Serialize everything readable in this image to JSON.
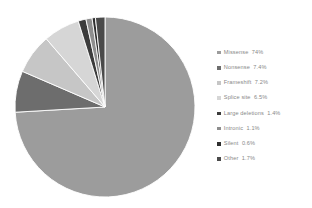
{
  "chart_data": {
    "type": "pie",
    "title": "",
    "subtitle": "",
    "xlabel": "",
    "ylabel": "",
    "legend_position": "right",
    "grid": false,
    "start_angle_deg": 0,
    "direction": "clockwise",
    "categories": [
      "Missense",
      "Nonsense",
      "Frameshift",
      "Splice site",
      "Large deletions",
      "Intronic",
      "Silent",
      "Other"
    ],
    "values": [
      74,
      7.4,
      7.2,
      6.5,
      1.4,
      1.1,
      0.6,
      1.7
    ],
    "value_labels": [
      "74%",
      "7.4%",
      "7.2%",
      "6.5%",
      "1.4%",
      "1.1%",
      "0.6%",
      "1.7%"
    ],
    "unit": "%",
    "colors": [
      "#9c9c9c",
      "#6d6d6d",
      "#c6c6c6",
      "#d6d6d6",
      "#3c3c3c",
      "#8e8e8e",
      "#2f2f2f",
      "#4a4a4a"
    ],
    "slices": [
      {
        "label": "Missense",
        "value": 74,
        "value_label": "74%",
        "color": "#9c9c9c"
      },
      {
        "label": "Nonsense",
        "value": 7.4,
        "value_label": "7.4%",
        "color": "#6d6d6d"
      },
      {
        "label": "Frameshift",
        "value": 7.2,
        "value_label": "7.2%",
        "color": "#c6c6c6"
      },
      {
        "label": "Splice site",
        "value": 6.5,
        "value_label": "6.5%",
        "color": "#d6d6d6"
      },
      {
        "label": "Large deletions",
        "value": 1.4,
        "value_label": "1.4%",
        "color": "#3c3c3c"
      },
      {
        "label": "Intronic",
        "value": 1.1,
        "value_label": "1.1%",
        "color": "#8e8e8e"
      },
      {
        "label": "Silent",
        "value": 0.6,
        "value_label": "0.6%",
        "color": "#2f2f2f"
      },
      {
        "label": "Other",
        "value": 1.7,
        "value_label": "1.7%",
        "color": "#4a4a4a"
      }
    ]
  },
  "legend": {
    "items": [
      {
        "label": "Missense",
        "value": "74%",
        "color": "#9c9c9c"
      },
      {
        "label": "Nonsense",
        "value": "7.4%",
        "color": "#6d6d6d"
      },
      {
        "label": "Frameshift",
        "value": "7.2%",
        "color": "#c6c6c6"
      },
      {
        "label": "Splice site",
        "value": "6.5%",
        "color": "#d6d6d6"
      },
      {
        "label": "Large deletions",
        "value": "1.4%",
        "color": "#3c3c3c"
      },
      {
        "label": "Intronic",
        "value": "1.1%",
        "color": "#8e8e8e"
      },
      {
        "label": "Silent",
        "value": "0.6%",
        "color": "#2f2f2f"
      },
      {
        "label": "Other",
        "value": "1.7%",
        "color": "#4a4a4a"
      }
    ]
  },
  "style": {
    "background": "#ffffff",
    "text_color": "#888888",
    "slice_separator": "#ffffff",
    "pie_center_x": 105,
    "pie_center_y": 107,
    "pie_radius": 90
  }
}
